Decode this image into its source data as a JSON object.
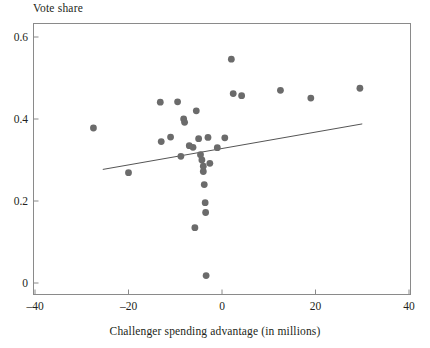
{
  "chart_data": {
    "type": "scatter",
    "title": "Vote share",
    "xlabel": "Challenger spending advantage (in millions)",
    "ylabel": "Vote share",
    "xlim": [
      -40,
      40
    ],
    "ylim": [
      0,
      0.62
    ],
    "xticks": [
      -40,
      -20,
      0,
      20,
      40
    ],
    "xtick_labels": [
      "–40",
      "–20",
      "0",
      "20",
      "40"
    ],
    "yticks": [
      0,
      0.2,
      0.4,
      0.6
    ],
    "ytick_labels": [
      "0",
      "0.2",
      "0.4",
      "0.6"
    ],
    "grid": false,
    "legend": null,
    "marker_color": "#6b6b6b",
    "line_color": "#555555",
    "axis_color": "#8a8a8a",
    "points": [
      {
        "x": -27.5,
        "y": 0.378
      },
      {
        "x": -20.0,
        "y": 0.269
      },
      {
        "x": -13.2,
        "y": 0.441
      },
      {
        "x": -13.0,
        "y": 0.345
      },
      {
        "x": -11.0,
        "y": 0.356
      },
      {
        "x": -9.5,
        "y": 0.442
      },
      {
        "x": -8.8,
        "y": 0.309
      },
      {
        "x": -8.2,
        "y": 0.4
      },
      {
        "x": -8.0,
        "y": 0.392
      },
      {
        "x": -7.0,
        "y": 0.335
      },
      {
        "x": -6.2,
        "y": 0.331
      },
      {
        "x": -5.5,
        "y": 0.42
      },
      {
        "x": -5.0,
        "y": 0.352
      },
      {
        "x": -4.6,
        "y": 0.313
      },
      {
        "x": -4.3,
        "y": 0.3
      },
      {
        "x": -4.0,
        "y": 0.285
      },
      {
        "x": -4.0,
        "y": 0.272
      },
      {
        "x": -3.8,
        "y": 0.24
      },
      {
        "x": -3.6,
        "y": 0.196
      },
      {
        "x": -3.5,
        "y": 0.172
      },
      {
        "x": -3.4,
        "y": 0.018
      },
      {
        "x": -3.0,
        "y": 0.355
      },
      {
        "x": -2.6,
        "y": 0.292
      },
      {
        "x": -5.8,
        "y": 0.135
      },
      {
        "x": -1.0,
        "y": 0.33
      },
      {
        "x": 0.6,
        "y": 0.354
      },
      {
        "x": 2.0,
        "y": 0.546
      },
      {
        "x": 2.4,
        "y": 0.462
      },
      {
        "x": 4.2,
        "y": 0.457
      },
      {
        "x": 12.5,
        "y": 0.47
      },
      {
        "x": 19.0,
        "y": 0.451
      },
      {
        "x": 29.5,
        "y": 0.475
      }
    ],
    "fit_line": {
      "x_start": -25.5,
      "y_start": 0.277,
      "x_end": 30.0,
      "y_end": 0.388
    }
  }
}
